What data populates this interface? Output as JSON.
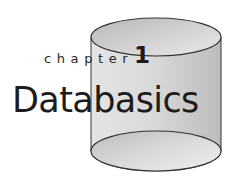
{
  "chapter": {
    "label": "chapter",
    "number": "1",
    "title": "Databasics"
  },
  "illustration": {
    "icon": "database-cylinder-icon",
    "colors": {
      "body_light": "#e6e6e6",
      "body_dark": "#bdbdbd",
      "outline": "#333333",
      "background": "#ffffff"
    }
  }
}
